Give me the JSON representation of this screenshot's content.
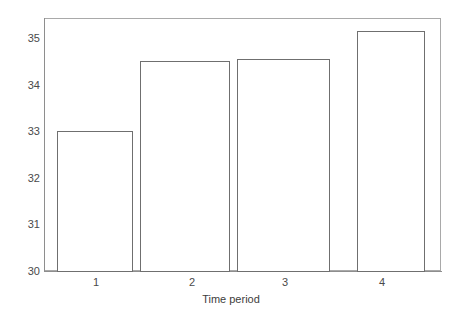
{
  "chart_data": {
    "type": "bar",
    "title": "",
    "subtitle": "",
    "xlabel": "Time period",
    "ylabel": "",
    "categories": [
      "1",
      "2",
      "3",
      "4"
    ],
    "values": [
      33.0,
      34.5,
      34.55,
      35.15
    ],
    "ylim": [
      30,
      35.5
    ],
    "yticks": [
      30,
      31,
      32,
      33,
      34,
      35
    ],
    "ytick_labels": [
      "30",
      "31",
      "32",
      "33",
      "34",
      "35"
    ],
    "xtick_labels": [
      "1",
      "2",
      "3",
      "4"
    ],
    "grid": false,
    "legend": null,
    "bar_fill": "#ffffff",
    "bar_edge_color": "#6f6f6f",
    "axis_color": "#8e8e8e",
    "frame_color": "#a9a9a9",
    "text_color": "#4a4a4a",
    "background": "#ffffff"
  },
  "axes": {
    "y_tick_0": "30",
    "y_tick_1": "31",
    "y_tick_2": "32",
    "y_tick_3": "33",
    "y_tick_4": "34",
    "y_tick_5": "35",
    "x_tick_0": "1",
    "x_tick_1": "2",
    "x_tick_2": "3",
    "x_tick_3": "4",
    "x_axis_title": "Time period"
  }
}
